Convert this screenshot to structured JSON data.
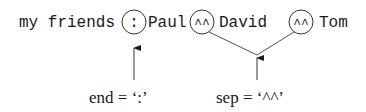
{
  "diagram": {
    "output_line": {
      "prefix": "my friends",
      "end_marker": ":",
      "items": [
        "Paul",
        "David",
        "Tom"
      ],
      "sep_marker": "^^"
    },
    "labels": {
      "end": "end = ‘:’",
      "sep": "sep = ‘^^’"
    },
    "colors": {
      "ink": "#1a1a1a",
      "line": "#555555"
    }
  }
}
